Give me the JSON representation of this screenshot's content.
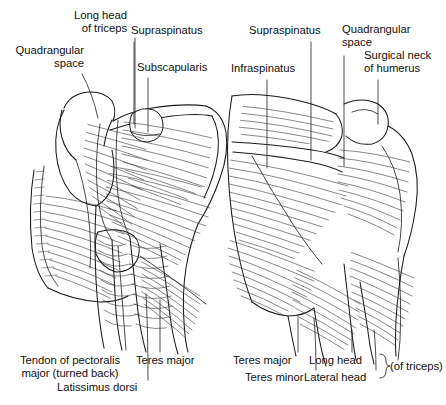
{
  "figure": {
    "view_left": "anterior",
    "view_right": "posterior",
    "background_color": "#ffffff",
    "line_color": "#1a1a1a",
    "hatch_color": "#3a3a3a",
    "text_color": "#121212"
  },
  "labels": {
    "quadrangular_space_left": "Quadrangular\nspace",
    "long_head_of_triceps": "Long head\nof triceps",
    "supraspinatus_left": "Supraspinatus",
    "subscapularis": "Subscapularis",
    "supraspinatus_right": "Supraspinatus",
    "infraspinatus": "Infraspinatus",
    "quadrangular_space_right": "Quadrangular\nspace",
    "surgical_neck_of_humerus": "Surgical neck\nof humerus",
    "tendon_of_pectoralis_major": "Tendon of pectoralis\nmajor (turned back)",
    "latissimus_dorsi": "Latissimus dorsi",
    "teres_major_left": "Teres major",
    "teres_major_right": "Teres major",
    "teres_minor": "Teres minor",
    "long_head": "Long head",
    "lateral_head": "Lateral head",
    "of_triceps": "(of triceps)"
  }
}
